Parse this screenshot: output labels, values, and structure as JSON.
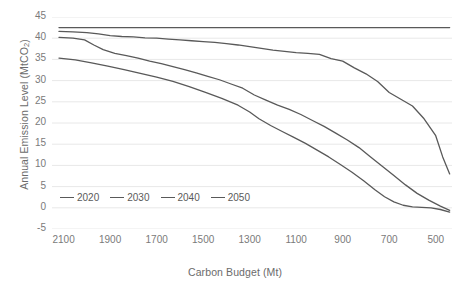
{
  "chart_data": {
    "type": "line",
    "title": "",
    "xlabel": "Carbon Budget (Mt)",
    "ylabel": "Annual Emission Level (MtCO2)",
    "ylabel_display": "Annual Emission Level (MtCO",
    "ylabel_sub": "2",
    "ylabel_tail": ")",
    "grid": "horizontal",
    "legend_position": "bottom-left-inside",
    "x_reversed": true,
    "xlim": [
      2150,
      430
    ],
    "ylim": [
      -5,
      45
    ],
    "xticks": [
      2100,
      1900,
      1700,
      1500,
      1300,
      1100,
      900,
      700,
      500
    ],
    "yticks": [
      -5,
      0,
      5,
      10,
      15,
      20,
      25,
      30,
      35,
      40,
      45
    ],
    "line_color": "#595959",
    "grid_color": "#e8e8e8",
    "axis_text_color": "#7a7a7a",
    "series": [
      {
        "name": "2020",
        "x": [
          2120,
          2000,
          1900,
          1800,
          1700,
          1600,
          1500,
          1400,
          1300,
          1200,
          1100,
          1000,
          900,
          800,
          700,
          600,
          500,
          440
        ],
        "values": [
          42.5,
          42.5,
          42.5,
          42.5,
          42.5,
          42.5,
          42.5,
          42.5,
          42.5,
          42.5,
          42.5,
          42.5,
          42.5,
          42.5,
          42.5,
          42.5,
          42.5,
          42.5
        ]
      },
      {
        "name": "2030",
        "x": [
          2120,
          2060,
          2000,
          1950,
          1900,
          1850,
          1800,
          1750,
          1700,
          1650,
          1600,
          1550,
          1500,
          1450,
          1400,
          1350,
          1300,
          1250,
          1200,
          1150,
          1100,
          1050,
          1000,
          950,
          900,
          850,
          800,
          750,
          700,
          650,
          600,
          550,
          500,
          470,
          440
        ],
        "values": [
          41.6,
          41.5,
          41.3,
          41.0,
          40.6,
          40.4,
          40.3,
          40.1,
          40.0,
          39.8,
          39.6,
          39.4,
          39.2,
          39.0,
          38.7,
          38.4,
          38.0,
          37.6,
          37.2,
          36.9,
          36.6,
          36.4,
          36.2,
          35.2,
          34.6,
          33.0,
          31.6,
          29.8,
          27.2,
          25.6,
          24.0,
          21.0,
          17.0,
          12.0,
          8.0
        ]
      },
      {
        "name": "2040",
        "x": [
          2120,
          2060,
          2010,
          1970,
          1930,
          1880,
          1830,
          1780,
          1730,
          1680,
          1630,
          1580,
          1530,
          1480,
          1430,
          1380,
          1330,
          1280,
          1230,
          1180,
          1130,
          1080,
          1030,
          980,
          930,
          880,
          830,
          780,
          730,
          680,
          630,
          580,
          530,
          480,
          440
        ],
        "values": [
          40.2,
          40.0,
          39.6,
          38.4,
          37.3,
          36.4,
          35.9,
          35.3,
          34.6,
          34.0,
          33.3,
          32.6,
          31.8,
          31.0,
          30.2,
          29.2,
          28.2,
          26.6,
          25.4,
          24.2,
          23.2,
          22.0,
          20.6,
          19.2,
          17.6,
          16.0,
          14.2,
          12.0,
          9.8,
          7.6,
          5.4,
          3.4,
          1.8,
          0.4,
          -0.6
        ]
      },
      {
        "name": "2050",
        "x": [
          2120,
          2050,
          1980,
          1910,
          1840,
          1770,
          1700,
          1630,
          1560,
          1490,
          1420,
          1350,
          1300,
          1260,
          1210,
          1160,
          1110,
          1060,
          1010,
          960,
          910,
          860,
          810,
          760,
          720,
          680,
          640,
          600,
          560,
          520,
          480,
          440
        ],
        "values": [
          35.3,
          34.9,
          34.2,
          33.4,
          32.6,
          31.7,
          30.8,
          29.8,
          28.6,
          27.2,
          25.8,
          24.2,
          22.6,
          21.0,
          19.4,
          18.0,
          16.6,
          15.2,
          13.6,
          12.0,
          10.2,
          8.4,
          6.4,
          4.2,
          2.6,
          1.4,
          0.6,
          0.2,
          0.1,
          0.0,
          -0.4,
          -1.0
        ]
      }
    ]
  }
}
